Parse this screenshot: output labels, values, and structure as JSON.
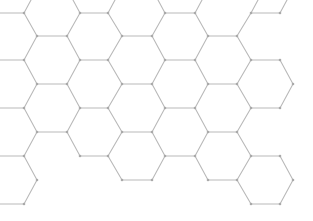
{
  "diagram": {
    "type": "hexagonal-grid",
    "orientation": "flat-top",
    "colors": {
      "edge": "#b9b9b9",
      "node": "#a9a9a9",
      "background": "#ffffff"
    },
    "edges": [
      [
        0,
        13,
        24,
        13
      ],
      [
        24,
        13,
        31,
        0
      ],
      [
        24,
        13,
        37,
        36
      ],
      [
        80,
        13,
        108,
        13
      ],
      [
        80,
        13,
        73,
        0
      ],
      [
        108,
        13,
        115,
        0
      ],
      [
        80,
        13,
        67,
        36
      ],
      [
        108,
        13,
        122,
        36
      ],
      [
        165,
        13,
        195,
        13
      ],
      [
        165,
        13,
        158,
        0
      ],
      [
        195,
        13,
        202,
        0
      ],
      [
        165,
        13,
        152,
        36
      ],
      [
        195,
        13,
        208,
        36
      ],
      [
        251,
        13,
        280,
        13
      ],
      [
        251,
        13,
        258,
        0
      ],
      [
        280,
        13,
        287,
        0
      ],
      [
        251,
        13,
        237,
        36
      ],
      [
        37,
        36,
        67,
        36
      ],
      [
        122,
        36,
        152,
        36
      ],
      [
        208,
        36,
        237,
        36
      ],
      [
        37,
        36,
        24,
        60
      ],
      [
        67,
        36,
        80,
        60
      ],
      [
        122,
        36,
        108,
        60
      ],
      [
        152,
        36,
        165,
        60
      ],
      [
        208,
        36,
        195,
        60
      ],
      [
        237,
        36,
        251,
        60
      ],
      [
        0,
        60,
        24,
        60
      ],
      [
        80,
        60,
        108,
        60
      ],
      [
        165,
        60,
        195,
        60
      ],
      [
        251,
        60,
        280,
        60
      ],
      [
        24,
        60,
        37,
        84
      ],
      [
        80,
        60,
        67,
        84
      ],
      [
        108,
        60,
        122,
        84
      ],
      [
        165,
        60,
        152,
        84
      ],
      [
        195,
        60,
        208,
        84
      ],
      [
        251,
        60,
        237,
        84
      ],
      [
        280,
        60,
        293,
        84
      ],
      [
        37,
        84,
        67,
        84
      ],
      [
        122,
        84,
        152,
        84
      ],
      [
        208,
        84,
        237,
        84
      ],
      [
        37,
        84,
        24,
        108
      ],
      [
        67,
        84,
        80,
        108
      ],
      [
        122,
        84,
        108,
        108
      ],
      [
        152,
        84,
        165,
        108
      ],
      [
        208,
        84,
        195,
        108
      ],
      [
        237,
        84,
        251,
        108
      ],
      [
        293,
        84,
        280,
        108
      ],
      [
        0,
        108,
        24,
        108
      ],
      [
        80,
        108,
        108,
        108
      ],
      [
        165,
        108,
        195,
        108
      ],
      [
        251,
        108,
        280,
        108
      ],
      [
        24,
        108,
        37,
        132
      ],
      [
        80,
        108,
        67,
        132
      ],
      [
        108,
        108,
        122,
        132
      ],
      [
        165,
        108,
        152,
        132
      ],
      [
        195,
        108,
        208,
        132
      ],
      [
        251,
        108,
        237,
        132
      ],
      [
        37,
        132,
        67,
        132
      ],
      [
        122,
        132,
        152,
        132
      ],
      [
        208,
        132,
        237,
        132
      ],
      [
        37,
        132,
        24,
        156
      ],
      [
        67,
        132,
        80,
        156
      ],
      [
        122,
        132,
        108,
        156
      ],
      [
        152,
        132,
        165,
        156
      ],
      [
        208,
        132,
        195,
        156
      ],
      [
        237,
        132,
        251,
        156
      ],
      [
        0,
        156,
        24,
        156
      ],
      [
        80,
        156,
        108,
        156
      ],
      [
        165,
        156,
        195,
        156
      ],
      [
        251,
        156,
        280,
        156
      ],
      [
        24,
        156,
        37,
        180
      ],
      [
        108,
        156,
        122,
        180
      ],
      [
        165,
        156,
        152,
        180
      ],
      [
        195,
        156,
        208,
        180
      ],
      [
        251,
        156,
        237,
        180
      ],
      [
        280,
        156,
        293,
        180
      ],
      [
        122,
        180,
        152,
        180
      ],
      [
        208,
        180,
        237,
        180
      ],
      [
        37,
        180,
        24,
        204
      ],
      [
        237,
        180,
        251,
        204
      ],
      [
        293,
        180,
        280,
        204
      ],
      [
        0,
        204,
        24,
        204
      ],
      [
        251,
        204,
        280,
        204
      ]
    ]
  }
}
